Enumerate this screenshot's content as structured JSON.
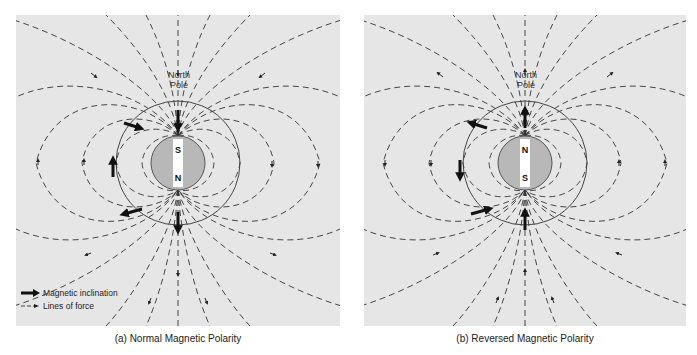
{
  "panels": [
    {
      "id": "a",
      "caption": "(a) Normal Magnetic Polarity",
      "pole_label_line1": "North",
      "pole_label_line2": "Pole",
      "magnet_top": "S",
      "magnet_bottom": "N",
      "field_direction": "inward-at-north"
    },
    {
      "id": "b",
      "caption": "(b) Reversed Magnetic Polarity",
      "pole_label_line1": "North",
      "pole_label_line2": "Pole",
      "magnet_top": "N",
      "magnet_bottom": "S",
      "field_direction": "outward-at-north"
    }
  ],
  "legend": {
    "inclination_label": "Magnetic inclination",
    "lines_label": "Lines of force"
  },
  "colors": {
    "panel_bg": "#e6e6e6",
    "globe_fill": "#b8b8b8",
    "line": "#333333",
    "arrow": "#111111",
    "bar": "#ffffff"
  }
}
